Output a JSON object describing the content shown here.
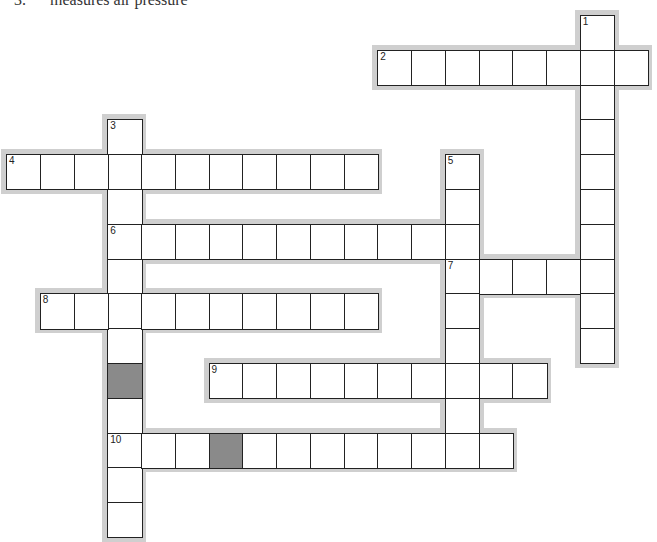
{
  "top_clue": {
    "number": "3.",
    "text": "measures air pressure"
  },
  "grid": {
    "cell_w": 33.75,
    "cell_h": 34.8,
    "origin_x": 6,
    "origin_y": 15,
    "block_color": "#8a8a8a",
    "frame_color": "#cfcfcf",
    "blocked_cells": [
      [
        10,
        3
      ],
      [
        12,
        6
      ]
    ]
  },
  "entries": [
    {
      "number": "1",
      "direction": "down",
      "row": 0,
      "col": 17,
      "length": 10
    },
    {
      "number": "2",
      "direction": "across",
      "row": 1,
      "col": 11,
      "length": 8
    },
    {
      "number": "3",
      "direction": "down",
      "row": 3,
      "col": 3,
      "length": 12
    },
    {
      "number": "4",
      "direction": "across",
      "row": 4,
      "col": 0,
      "length": 11
    },
    {
      "number": "5",
      "direction": "down",
      "row": 4,
      "col": 13,
      "length": 9
    },
    {
      "number": "6",
      "direction": "across",
      "row": 6,
      "col": 3,
      "length": 11
    },
    {
      "number": "7",
      "direction": "across",
      "row": 7,
      "col": 13,
      "length": 5
    },
    {
      "number": "8",
      "direction": "across",
      "row": 8,
      "col": 1,
      "length": 10
    },
    {
      "number": "9",
      "direction": "across",
      "row": 10,
      "col": 6,
      "length": 10
    },
    {
      "number": "10",
      "direction": "across",
      "row": 12,
      "col": 3,
      "length": 12
    }
  ]
}
